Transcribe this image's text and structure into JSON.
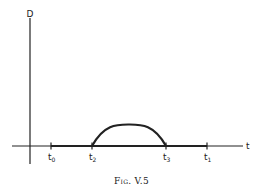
{
  "figure": {
    "caption": "Fig. V.5",
    "y_axis_label": "D",
    "x_axis_label": "t",
    "ticks": [
      {
        "base": "t",
        "sub": "0",
        "x": 51
      },
      {
        "base": "t",
        "sub": "2",
        "x": 92
      },
      {
        "base": "t",
        "sub": "3",
        "x": 166
      },
      {
        "base": "t",
        "sub": "1",
        "x": 207
      }
    ],
    "colors": {
      "ink": "#222222",
      "background": "#ffffff"
    }
  },
  "diagram_description": {
    "type": "function-plot",
    "description": "D as a function of t: zero on [t0, t2] and [t3, t1] (drawn as a thick segment on the t-axis), with a single positive hump between t2 and t3."
  }
}
